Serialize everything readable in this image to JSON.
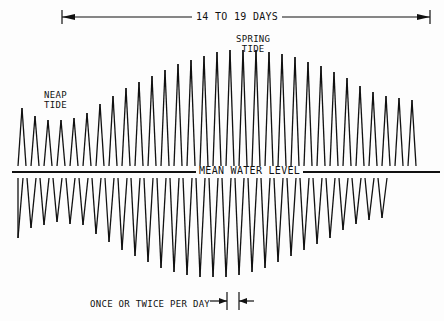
{
  "diagram": {
    "span_label": "14 TO 19 DAYS",
    "spring_label_1": "SPRING",
    "spring_label_2": "TIDE",
    "neap_label_1": "NEAP",
    "neap_label_2": "TIDE",
    "mean_level_label": "MEAN WATER LEVEL",
    "period_label": "ONCE OR TWICE PER DAY",
    "line_color": "#111111",
    "mean_level_y": 172,
    "wave": {
      "start_x": 14,
      "step": 13,
      "highs": [
        108,
        116,
        120,
        120,
        118,
        113,
        104,
        96,
        88,
        82,
        76,
        70,
        64,
        60,
        56,
        52,
        50,
        50,
        50,
        52,
        54,
        57,
        62,
        66,
        72,
        78,
        86,
        92,
        96,
        98,
        100
      ],
      "lows": [
        238,
        228,
        225,
        222,
        224,
        225,
        234,
        242,
        250,
        256,
        262,
        268,
        272,
        275,
        277,
        277,
        277,
        275,
        272,
        268,
        262,
        256,
        250,
        244,
        238,
        230,
        224,
        220,
        218
      ]
    }
  }
}
